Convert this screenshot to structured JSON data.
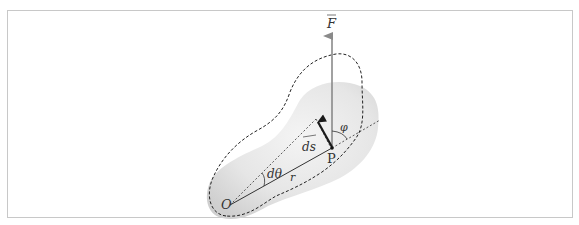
{
  "figure": {
    "frame_color": "#c8c8c8",
    "blob_color": "#e4e4e4",
    "labels": {
      "force": "F",
      "origin": "O",
      "point": "P",
      "displacement": "ds",
      "radius": "r",
      "angle_dtheta": "dθ",
      "angle_phi": "φ"
    },
    "colors": {
      "force_vector": "#8a8a8a",
      "ds_vector": "#1a1a1a",
      "lines": "#333333"
    }
  }
}
